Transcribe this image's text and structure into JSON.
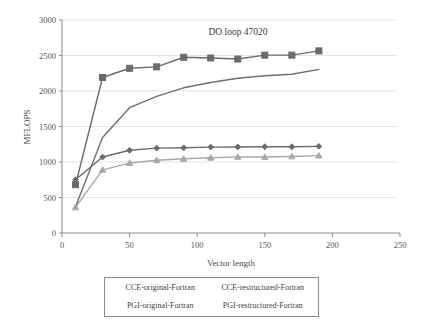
{
  "chart_data": {
    "type": "line",
    "title": "DO loop 47020",
    "xlabel": "Vector length",
    "ylabel": "MFLOPS",
    "xlim": [
      0,
      250
    ],
    "ylim": [
      0,
      3000
    ],
    "xticks": [
      0,
      50,
      100,
      150,
      200,
      250
    ],
    "yticks": [
      0,
      500,
      1000,
      1500,
      2000,
      2500,
      3000
    ],
    "grid": "horizontal",
    "legend_position": "bottom-outside",
    "x": [
      10,
      30,
      50,
      70,
      90,
      110,
      130,
      150,
      170,
      190
    ],
    "series": [
      {
        "name": "CCE-original-Fortran",
        "marker": "square",
        "color": "#6b6b6b",
        "values": [
          680,
          2190,
          2320,
          2340,
          2475,
          2465,
          2450,
          2505,
          2505,
          2565
        ]
      },
      {
        "name": "CCE-restructured-Fortran",
        "marker": "none",
        "color": "#6f6f6f",
        "values": [
          370,
          1345,
          1765,
          1925,
          2045,
          2120,
          2180,
          2215,
          2235,
          2305
        ]
      },
      {
        "name": "PGI-original-Fortran",
        "marker": "diamond",
        "color": "#6b6b6b",
        "values": [
          750,
          1070,
          1165,
          1195,
          1200,
          1210,
          1212,
          1215,
          1215,
          1220
        ]
      },
      {
        "name": "PGI-restructured-Fortran",
        "marker": "triangle",
        "color": "#a8a8a8",
        "values": [
          360,
          890,
          985,
          1025,
          1045,
          1060,
          1072,
          1070,
          1078,
          1090
        ]
      }
    ]
  },
  "axes": {
    "ytick_labels": [
      "3000",
      "2500",
      "2000",
      "1500",
      "1000",
      "500",
      "0"
    ],
    "xtick_labels": [
      "0",
      "50",
      "100",
      "150",
      "200",
      "250"
    ],
    "ylabel": "MFLOPS",
    "xlabel": "Vector length"
  },
  "title": {
    "text": "DO loop 47020"
  },
  "legend": {
    "entries": [
      {
        "label": "CCE-original-Fortran"
      },
      {
        "label": "CCE-restructured-Fortran"
      },
      {
        "label": "PGI-original-Fortran"
      },
      {
        "label": "PGI-restructured-Fortran"
      }
    ]
  },
  "colors": {
    "dark_series": "#6b6b6b",
    "light_series": "#a8a8a8",
    "axis": "#8a8a8a",
    "grid": "#dcdcdc",
    "text": "#3f3f3f"
  }
}
